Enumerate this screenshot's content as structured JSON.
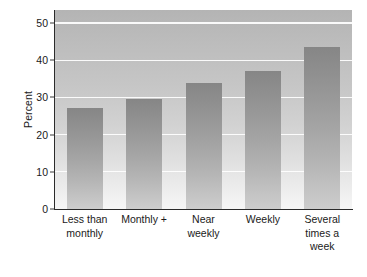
{
  "chart_data": {
    "type": "bar",
    "title": "",
    "subtitle": "",
    "xlabel": "",
    "ylabel": "Percent",
    "categories": [
      "Less than\nmonthly",
      "Monthly +",
      "Near\nweekly",
      "Weekly",
      "Several\ntimes a\nweek"
    ],
    "values": [
      27.2,
      29.7,
      33.8,
      37.0,
      43.6
    ],
    "ylim": [
      0,
      53.5
    ],
    "yticks": [
      0,
      10,
      20,
      30,
      40,
      50
    ],
    "ytick_labels": [
      "0",
      "10",
      "20",
      "30",
      "40",
      "50"
    ],
    "grid": true,
    "grid_axis": "y",
    "legend": "none",
    "colors": {
      "bar_top": "#868686",
      "bar_bottom": "#cdcdcd",
      "panel_top": "#b4b4b4",
      "panel_bottom": "#f6f6f6",
      "gridline": "#ffffff",
      "axis": "#2b2b2b",
      "text": "#1a1a1a"
    }
  }
}
